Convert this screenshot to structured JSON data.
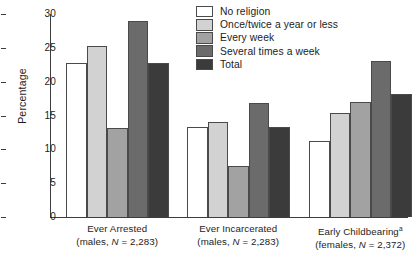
{
  "chart_data": {
    "type": "bar",
    "title": "",
    "xlabel": "",
    "ylabel": "Percentage",
    "ylim": [
      0,
      30
    ],
    "yticks": [
      0,
      5,
      10,
      15,
      20,
      25,
      30
    ],
    "grid": false,
    "legend_position": "top-right",
    "categories": [
      "Ever Arrested (males, N = 2,283)",
      "Ever Incarcerated (males, N = 2,283)",
      "Early Childbearing (females, N = 2,372)"
    ],
    "group_labels": [
      {
        "line1": "Ever Arrested",
        "line2": "(males, N = 2,283)",
        "superscript": ""
      },
      {
        "line1": "Ever Incarcerated",
        "line2": "(males, N = 2,283)",
        "superscript": ""
      },
      {
        "line1": "Early Childbearing",
        "line2": "(females, N = 2,372)",
        "superscript": "a"
      }
    ],
    "series": [
      {
        "name": "No religion",
        "color": "#ffffff",
        "values": [
          22.8,
          13.3,
          11.2
        ]
      },
      {
        "name": "Once/twice a year or less",
        "color": "#d2d2d2",
        "values": [
          25.2,
          14.0,
          15.4
        ]
      },
      {
        "name": "Every week",
        "color": "#a2a2a2",
        "values": [
          13.1,
          7.5,
          17.0
        ]
      },
      {
        "name": "Several times a week",
        "color": "#6b6b6b",
        "values": [
          29.0,
          16.8,
          23.0
        ]
      },
      {
        "name": "Total",
        "color": "#3b3b3b",
        "values": [
          22.7,
          13.3,
          18.2
        ]
      }
    ]
  },
  "legend": {
    "items": [
      {
        "label": "No religion",
        "color": "#ffffff"
      },
      {
        "label": "Once/twice a year or less",
        "color": "#d2d2d2"
      },
      {
        "label": "Every week",
        "color": "#a2a2a2"
      },
      {
        "label": "Several times a week",
        "color": "#6b6b6b"
      },
      {
        "label": "Total",
        "color": "#3b3b3b"
      }
    ]
  },
  "axis": {
    "y_title": "Percentage",
    "y_tick_labels": [
      "30",
      "25",
      "20",
      "15",
      "10",
      "5",
      "0"
    ]
  }
}
